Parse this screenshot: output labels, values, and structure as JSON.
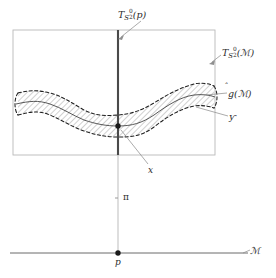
{
  "figure": {
    "domain": "mathematical-diagram",
    "background_color": "#ffffff",
    "ink_color": "#2b2b2b",
    "rule_color": "#b9b9b9",
    "hatch_color": "#8a8a8a"
  },
  "labels": {
    "fiber_over_p": {
      "name": "T_{S_2^0}(p)",
      "base": "T",
      "sub": "S",
      "sub_sub": "2",
      "sub_sup": "0",
      "arg": "(p)"
    },
    "total_space": {
      "name": "T_{S_2^0}(M)",
      "base": "T",
      "sub": "S",
      "sub_sub": "2",
      "sub_sup": "0",
      "arg": "(ℳ)"
    },
    "section_curve": {
      "name": "ĝ(ℳ)",
      "base": "g",
      "accent": "̂",
      "arg": "(ℳ)"
    },
    "band": {
      "name": "ƴ",
      "text": "ƴ"
    },
    "point_x": {
      "name": "x",
      "text": "x"
    },
    "projection": {
      "name": "pi",
      "text": "π"
    },
    "point_p": {
      "name": "p",
      "text": "p"
    },
    "base_manifold": {
      "name": "M",
      "text": "ℳ"
    }
  },
  "geometry": {
    "rectangle": {
      "x": 13,
      "y": 30,
      "width": 202,
      "height": 125
    },
    "fiber_line": {
      "x": 118,
      "y_top": 30,
      "y_bottom": 155,
      "width": 2.2
    },
    "thin_fiber_line": {
      "x": 118,
      "y_top": 155,
      "y_bottom": 253
    },
    "base_line": {
      "x_start": 10,
      "x_end": 248,
      "y": 253
    },
    "point_x": {
      "x": 118,
      "y": 126,
      "r": 2.6
    },
    "point_p": {
      "x": 118,
      "y": 253,
      "r": 2.6
    },
    "pi_tick": {
      "x": 118,
      "y": 198
    },
    "band_center_samples": [
      [
        18,
        104
      ],
      [
        40,
        102
      ],
      [
        62,
        109
      ],
      [
        84,
        120
      ],
      [
        104,
        126
      ],
      [
        118,
        126
      ],
      [
        134,
        124
      ],
      [
        152,
        115
      ],
      [
        172,
        101
      ],
      [
        194,
        95
      ],
      [
        214,
        97
      ]
    ],
    "band_half_thickness": 11
  },
  "leaders": {
    "fiber_over_p": {
      "from": [
        140,
        22
      ],
      "to": [
        121,
        36
      ]
    },
    "total_space": {
      "from": [
        220,
        54
      ],
      "to": [
        211,
        61
      ]
    },
    "section_curve": {
      "from": [
        226,
        92
      ],
      "to": [
        208,
        95
      ]
    },
    "band": {
      "from": [
        227,
        115
      ],
      "to": [
        196,
        106
      ]
    },
    "point_x": {
      "from": [
        147,
        163
      ],
      "to": [
        121,
        130
      ]
    }
  }
}
